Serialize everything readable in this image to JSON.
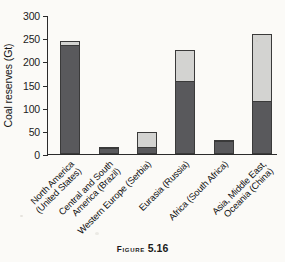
{
  "caption": {
    "word": "Figure",
    "number": "5.16"
  },
  "chart_data": {
    "type": "bar",
    "title": "",
    "xlabel": "",
    "ylabel": "Coal reserves (Gt)",
    "ylim": [
      0,
      300
    ],
    "yticks": [
      0,
      50,
      100,
      150,
      200,
      250,
      300
    ],
    "ytick_labels": [
      "0",
      "50",
      "100",
      "150",
      "200",
      "250",
      "300"
    ],
    "grid": false,
    "legend": "none",
    "stacked": true,
    "categories": [
      "North America\n(United States)",
      "Central and South\nAmerica (Brazil)",
      "Western Europe (Serbia)",
      "Eurasia (Russia)",
      "Africa (South Africa)",
      "Asia, Middle East,\nOceania (China)"
    ],
    "series": [
      {
        "name": "hard coal",
        "color": "#59595c",
        "values": [
          235,
          13,
          15,
          157,
          28,
          114
        ]
      },
      {
        "name": "green segment",
        "color": "#2fb96a",
        "values": [
          0,
          0,
          0,
          0,
          3,
          0
        ]
      },
      {
        "name": "lignite / sub-bituminous",
        "color": "#d3d3d1",
        "values": [
          10,
          2,
          32,
          68,
          0,
          146
        ]
      }
    ],
    "totals": [
      245,
      15,
      47,
      225,
      31,
      260
    ]
  }
}
